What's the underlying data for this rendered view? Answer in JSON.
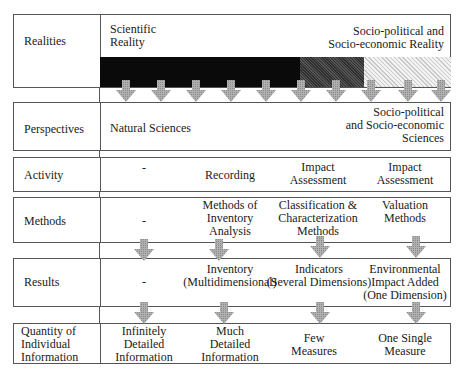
{
  "rows": {
    "realities": {
      "label": "Realities",
      "scientific": [
        "Scientific",
        "Reality"
      ],
      "socio": [
        "Socio-political and",
        "Socio-economic Reality"
      ]
    },
    "perspectives": {
      "label": "Perspectives",
      "natural": "Natural Sciences",
      "socio": [
        "Socio-political",
        "and Socio-economic",
        "Sciences"
      ]
    },
    "activity": {
      "label": "Activity",
      "cells": [
        "-",
        "Recording",
        "Impact\nAssessment",
        "Impact\nAssessment"
      ]
    },
    "methods": {
      "label": "Methods",
      "cells": [
        "-",
        "Methods of\nInventory\nAnalysis",
        "Classification &\nCharacterization\nMethods",
        "Valuation\nMethods"
      ]
    },
    "results": {
      "label": "Results",
      "cells": [
        "-",
        "Inventory\n(Multidimensional)",
        "Indicators\n(Several Dimensions)",
        "Environmental\nImpact Added\n(One Dimension)"
      ]
    },
    "quantity": {
      "label": "Quantity of\nIndividual\nInformation",
      "cells": [
        "Infinitely\nDetailed\nInformation",
        "Much\nDetailed\nInformation",
        "Few\nMeasures",
        "One Single\nMeasure"
      ]
    }
  },
  "colors": {
    "band_black": "#0a0a0a",
    "band_dark": "#3a3a3a",
    "band_light": "#d8d8d8",
    "arrow": "#a8a8a8",
    "border": "#555555"
  }
}
